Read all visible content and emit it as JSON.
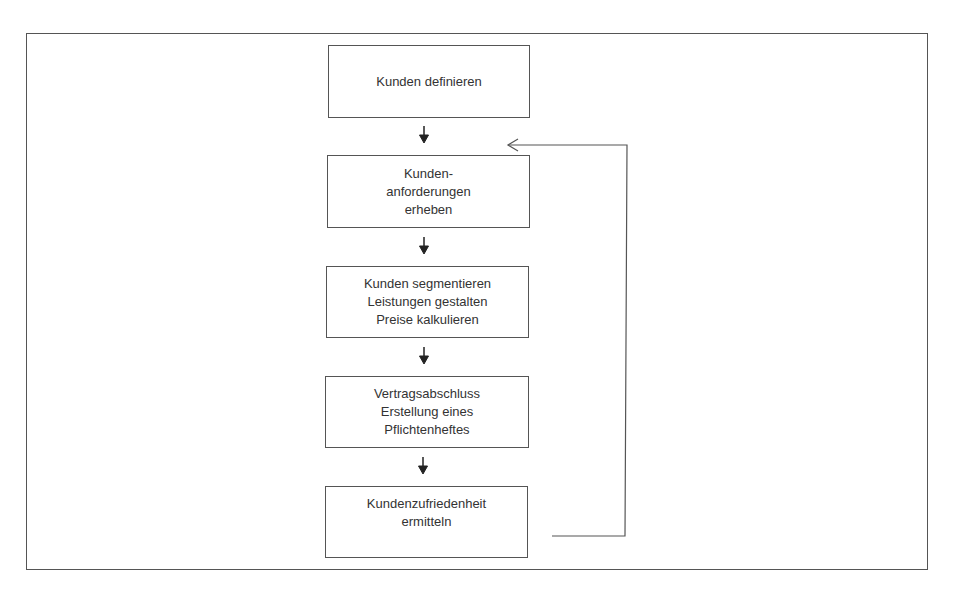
{
  "diagram": {
    "type": "flowchart",
    "steps": [
      {
        "id": "step1",
        "lines": [
          "Kunden definieren"
        ]
      },
      {
        "id": "step2",
        "lines": [
          "Kunden-",
          "anforderungen",
          "erheben"
        ]
      },
      {
        "id": "step3",
        "lines": [
          "Kunden segmentieren",
          "Leistungen gestalten",
          "Preise kalkulieren"
        ]
      },
      {
        "id": "step4",
        "lines": [
          "Vertragsabschluss",
          "Erstellung eines",
          "Pflichtenheftes"
        ]
      },
      {
        "id": "step5",
        "lines": [
          "Kundenzufriedenheit",
          "ermitteln"
        ]
      }
    ],
    "edges": [
      {
        "from": "step1",
        "to": "step2"
      },
      {
        "from": "step2",
        "to": "step3"
      },
      {
        "from": "step3",
        "to": "step4"
      },
      {
        "from": "step4",
        "to": "step5"
      },
      {
        "from": "step5",
        "to": "step2",
        "kind": "feedback-loop"
      }
    ],
    "colors": {
      "line": "#555555",
      "text": "#333333",
      "background": "#ffffff"
    }
  }
}
